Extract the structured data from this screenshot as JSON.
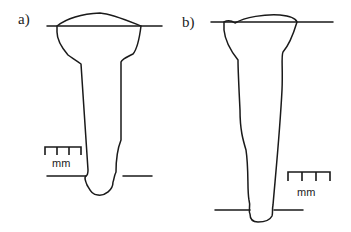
{
  "figure": {
    "panels": [
      {
        "id": "a",
        "label": "a)",
        "scale_unit": "mm"
      },
      {
        "id": "b",
        "label": "b)",
        "scale_unit": "mm"
      }
    ]
  }
}
